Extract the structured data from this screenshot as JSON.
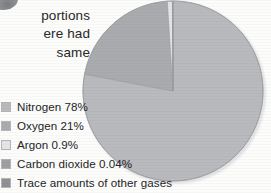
{
  "figure": {
    "kind": "pie-chart-with-legend",
    "background_color": "#fcfcfb",
    "text_color": "#232427"
  },
  "body_copy": {
    "note": "right-hand fragment of a paragraph; left side is cut off by the image crop",
    "lines": [
      "portions",
      "ere had",
      "same"
    ]
  },
  "corner_mark": {
    "icon": "partial-dark-glyph"
  },
  "legend": {
    "items": [
      {
        "label": "Nitrogen 78%",
        "color": "#b9babd"
      },
      {
        "label": "Oxygen 21%",
        "color": "#a9abaf"
      },
      {
        "label": "Argon 0.9%",
        "color": "#e4e5e6"
      },
      {
        "label": "Carbon dioxide 0.04%",
        "color": "#9d9fa3"
      },
      {
        "label": "Trace amounts of other gases",
        "color": "#8f9195"
      }
    ]
  },
  "chart_data": {
    "type": "pie",
    "title": "",
    "labels": [
      "Nitrogen 78%",
      "Oxygen 21%",
      "Argon 0.9%",
      "Carbon dioxide 0.04%",
      "Trace amounts of other gases"
    ],
    "categories": [
      "Nitrogen",
      "Oxygen",
      "Argon",
      "Carbon dioxide",
      "Trace amounts of other gases"
    ],
    "values": [
      78,
      21,
      0.9,
      0.04,
      0.06
    ],
    "value_labels": [
      "78%",
      "21%",
      "0.9%",
      "0.04%",
      ""
    ],
    "unit": "percent",
    "colors": [
      "#b9babd",
      "#a9abaf",
      "#e4e5e6",
      "#9d9fa3",
      "#8f9195"
    ],
    "start_angle_deg": 0,
    "direction": "clockwise",
    "legend_position": "left-below",
    "grid": false,
    "geometry": {
      "center_x": 173,
      "center_y": 91,
      "radius": 91
    }
  }
}
